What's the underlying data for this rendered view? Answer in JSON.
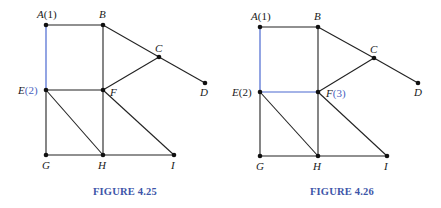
{
  "figures": [
    {
      "caption": "FIGURE 4.25",
      "highlight_color": "#4a68d0",
      "nodes": {
        "A": {
          "x": 46,
          "y": 25,
          "name": "A",
          "tag": "(1)",
          "tag_highlight": false
        },
        "B": {
          "x": 103,
          "y": 25,
          "name": "B",
          "tag": ""
        },
        "C": {
          "x": 159,
          "y": 57,
          "name": "C",
          "tag": ""
        },
        "D": {
          "x": 205,
          "y": 83,
          "name": "D",
          "tag": ""
        },
        "E": {
          "x": 46,
          "y": 90,
          "name": "E",
          "tag": "(2)",
          "tag_highlight": true
        },
        "F": {
          "x": 103,
          "y": 90,
          "name": "F",
          "tag": ""
        },
        "G": {
          "x": 46,
          "y": 155,
          "name": "G",
          "tag": ""
        },
        "H": {
          "x": 103,
          "y": 155,
          "name": "H",
          "tag": ""
        },
        "I": {
          "x": 174,
          "y": 155,
          "name": "I",
          "tag": ""
        }
      },
      "edges": [
        [
          "A",
          "B",
          false
        ],
        [
          "A",
          "E",
          true
        ],
        [
          "B",
          "F",
          false
        ],
        [
          "B",
          "C",
          false
        ],
        [
          "C",
          "D",
          false
        ],
        [
          "C",
          "F",
          false
        ],
        [
          "E",
          "F",
          false
        ],
        [
          "E",
          "G",
          false
        ],
        [
          "E",
          "H",
          false
        ],
        [
          "F",
          "H",
          false
        ],
        [
          "F",
          "I",
          false
        ],
        [
          "G",
          "H",
          false
        ],
        [
          "H",
          "I",
          false
        ]
      ]
    },
    {
      "caption": "FIGURE 4.26",
      "highlight_color": "#4a68d0",
      "nodes": {
        "A": {
          "x": 260,
          "y": 27,
          "name": "A",
          "tag": "(1)",
          "tag_highlight": false
        },
        "B": {
          "x": 318,
          "y": 27,
          "name": "B",
          "tag": ""
        },
        "C": {
          "x": 374,
          "y": 58,
          "name": "C",
          "tag": ""
        },
        "D": {
          "x": 418,
          "y": 83,
          "name": "D",
          "tag": ""
        },
        "E": {
          "x": 260,
          "y": 92,
          "name": "E",
          "tag": "(2)",
          "tag_highlight": false
        },
        "F": {
          "x": 318,
          "y": 92,
          "name": "F",
          "tag": "(3)",
          "tag_highlight": true
        },
        "G": {
          "x": 260,
          "y": 156,
          "name": "G",
          "tag": ""
        },
        "H": {
          "x": 318,
          "y": 156,
          "name": "H",
          "tag": ""
        },
        "I": {
          "x": 387,
          "y": 156,
          "name": "I",
          "tag": ""
        }
      },
      "edges": [
        [
          "A",
          "B",
          false
        ],
        [
          "A",
          "E",
          true
        ],
        [
          "B",
          "F",
          false
        ],
        [
          "B",
          "C",
          false
        ],
        [
          "C",
          "D",
          false
        ],
        [
          "C",
          "F",
          false
        ],
        [
          "E",
          "F",
          true
        ],
        [
          "E",
          "G",
          false
        ],
        [
          "E",
          "H",
          false
        ],
        [
          "F",
          "H",
          false
        ],
        [
          "F",
          "I",
          false
        ],
        [
          "G",
          "H",
          false
        ],
        [
          "H",
          "I",
          false
        ]
      ]
    }
  ],
  "labels": {
    "fig1": {
      "A": "A",
      "A_tag": "(1)",
      "B": "B",
      "C": "C",
      "D": "D",
      "E": "E",
      "E_tag": "(2)",
      "F": "F",
      "G": "G",
      "H": "H",
      "I": "I"
    },
    "fig2": {
      "A": "A",
      "A_tag": "(1)",
      "B": "B",
      "C": "C",
      "D": "D",
      "E": "E",
      "E_tag": "(2)",
      "F": "F",
      "F_tag": "(3)",
      "G": "G",
      "H": "H",
      "I": "I"
    }
  },
  "captions": {
    "fig1": "FIGURE 4.25",
    "fig2": "FIGURE 4.26"
  }
}
